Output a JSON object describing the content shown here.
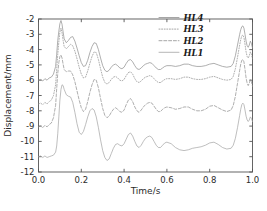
{
  "chart_data": {
    "type": "line",
    "title": "",
    "xlabel": "Time/s",
    "ylabel": "Displacement/mm",
    "xlim": [
      0.0,
      1.0
    ],
    "ylim": [
      -12,
      -2
    ],
    "xticks": [
      "0.0",
      "0.2",
      "0.4",
      "0.6",
      "0.8",
      "1.0"
    ],
    "xtick_values": [
      0.0,
      0.2,
      0.4,
      0.6,
      0.8,
      1.0
    ],
    "yticks": [
      "-2",
      "-3",
      "-4",
      "-5",
      "-6",
      "-7",
      "-8",
      "-9",
      "-10",
      "-11",
      "-12"
    ],
    "ytick_values": [
      -2,
      -3,
      -4,
      -5,
      -6,
      -7,
      -8,
      -9,
      -10,
      -11,
      -12
    ],
    "grid": false,
    "legend_position": "top-right",
    "legend_entries": [
      "HL4",
      "HL3",
      "HL2",
      "HL1"
    ],
    "line_color": "#8a8a8a",
    "axis_color": "#555555",
    "series": [
      {
        "name": "HL4",
        "style": "solid",
        "color": "#8f8f8f",
        "x": [
          0.0,
          0.01,
          0.02,
          0.03,
          0.04,
          0.05,
          0.06,
          0.07,
          0.08,
          0.085,
          0.09,
          0.095,
          0.1,
          0.105,
          0.11,
          0.115,
          0.12,
          0.13,
          0.14,
          0.15,
          0.16,
          0.17,
          0.18,
          0.19,
          0.2,
          0.21,
          0.22,
          0.23,
          0.24,
          0.25,
          0.26,
          0.27,
          0.28,
          0.29,
          0.3,
          0.31,
          0.32,
          0.33,
          0.34,
          0.35,
          0.36,
          0.37,
          0.38,
          0.39,
          0.4,
          0.41,
          0.42,
          0.43,
          0.44,
          0.45,
          0.46,
          0.47,
          0.48,
          0.49,
          0.5,
          0.51,
          0.52,
          0.53,
          0.54,
          0.55,
          0.56,
          0.57,
          0.58,
          0.59,
          0.6,
          0.62,
          0.64,
          0.66,
          0.68,
          0.7,
          0.72,
          0.74,
          0.76,
          0.78,
          0.8,
          0.82,
          0.84,
          0.86,
          0.88,
          0.9,
          0.91,
          0.92,
          0.93,
          0.94,
          0.945,
          0.95,
          0.955,
          0.96,
          0.965,
          0.97,
          0.975,
          0.98,
          0.985,
          0.99,
          0.995,
          1.0
        ],
        "y": [
          -6.0,
          -5.95,
          -6.05,
          -5.9,
          -6.0,
          -5.85,
          -5.8,
          -5.6,
          -5.1,
          -4.3,
          -3.4,
          -2.8,
          -2.3,
          -2.1,
          -2.35,
          -2.85,
          -3.3,
          -3.55,
          -3.4,
          -3.2,
          -3.15,
          -3.45,
          -3.9,
          -4.4,
          -4.85,
          -5.1,
          -5.05,
          -4.7,
          -4.2,
          -3.8,
          -3.55,
          -3.6,
          -4.0,
          -4.55,
          -5.05,
          -5.35,
          -5.45,
          -5.35,
          -5.15,
          -5.0,
          -4.95,
          -5.05,
          -5.2,
          -5.25,
          -5.15,
          -4.9,
          -4.7,
          -4.65,
          -4.8,
          -5.05,
          -5.25,
          -5.3,
          -5.2,
          -5.05,
          -4.95,
          -4.9,
          -4.85,
          -4.9,
          -5.05,
          -5.2,
          -5.3,
          -5.3,
          -5.2,
          -5.1,
          -5.05,
          -5.05,
          -5.1,
          -5.05,
          -4.95,
          -4.95,
          -5.05,
          -5.1,
          -5.1,
          -5.05,
          -4.95,
          -4.9,
          -5.0,
          -5.1,
          -5.15,
          -5.1,
          -4.9,
          -4.4,
          -3.7,
          -3.0,
          -2.7,
          -2.5,
          -2.45,
          -2.6,
          -3.0,
          -3.45,
          -3.75,
          -3.85,
          -3.7,
          -3.45,
          -3.6,
          -3.9
        ]
      },
      {
        "name": "HL3",
        "style": "dotted",
        "color": "#8f8f8f",
        "x": [
          0.0,
          0.01,
          0.02,
          0.03,
          0.04,
          0.05,
          0.06,
          0.07,
          0.08,
          0.085,
          0.09,
          0.095,
          0.1,
          0.105,
          0.11,
          0.115,
          0.12,
          0.13,
          0.14,
          0.15,
          0.16,
          0.17,
          0.18,
          0.19,
          0.2,
          0.21,
          0.22,
          0.23,
          0.24,
          0.25,
          0.26,
          0.27,
          0.28,
          0.29,
          0.3,
          0.31,
          0.32,
          0.33,
          0.34,
          0.35,
          0.36,
          0.37,
          0.38,
          0.39,
          0.4,
          0.41,
          0.42,
          0.43,
          0.44,
          0.45,
          0.46,
          0.47,
          0.48,
          0.49,
          0.5,
          0.51,
          0.52,
          0.53,
          0.54,
          0.55,
          0.56,
          0.57,
          0.58,
          0.59,
          0.6,
          0.62,
          0.64,
          0.66,
          0.68,
          0.7,
          0.72,
          0.74,
          0.76,
          0.78,
          0.8,
          0.82,
          0.84,
          0.86,
          0.88,
          0.9,
          0.91,
          0.92,
          0.93,
          0.94,
          0.945,
          0.95,
          0.955,
          0.96,
          0.965,
          0.97,
          0.975,
          0.98,
          0.985,
          0.99,
          0.995,
          1.0
        ],
        "y": [
          -7.55,
          -7.5,
          -7.6,
          -7.45,
          -7.55,
          -7.4,
          -7.3,
          -7.0,
          -6.3,
          -5.3,
          -4.3,
          -3.5,
          -2.85,
          -2.6,
          -2.9,
          -3.4,
          -3.8,
          -3.95,
          -3.8,
          -3.65,
          -3.75,
          -4.1,
          -4.6,
          -5.15,
          -5.6,
          -5.85,
          -5.8,
          -5.4,
          -4.9,
          -4.45,
          -4.15,
          -4.2,
          -4.65,
          -5.25,
          -5.8,
          -6.15,
          -6.25,
          -6.15,
          -5.95,
          -5.8,
          -5.75,
          -5.85,
          -6.0,
          -6.05,
          -5.95,
          -5.7,
          -5.5,
          -5.45,
          -5.6,
          -5.9,
          -6.1,
          -6.15,
          -6.05,
          -5.9,
          -5.8,
          -5.75,
          -5.7,
          -5.75,
          -5.9,
          -6.05,
          -6.15,
          -6.15,
          -6.05,
          -5.95,
          -5.9,
          -5.9,
          -5.95,
          -5.9,
          -5.8,
          -5.8,
          -5.9,
          -5.95,
          -5.95,
          -5.9,
          -5.8,
          -5.75,
          -5.85,
          -5.95,
          -6.0,
          -5.95,
          -5.75,
          -5.25,
          -4.5,
          -3.7,
          -3.35,
          -3.1,
          -3.05,
          -3.2,
          -3.65,
          -4.15,
          -4.45,
          -4.55,
          -4.4,
          -4.15,
          -4.3,
          -4.6
        ]
      },
      {
        "name": "HL2",
        "style": "dashed",
        "color": "#8f8f8f",
        "x": [
          0.0,
          0.01,
          0.02,
          0.03,
          0.04,
          0.05,
          0.06,
          0.07,
          0.08,
          0.085,
          0.09,
          0.095,
          0.1,
          0.105,
          0.11,
          0.115,
          0.12,
          0.13,
          0.14,
          0.15,
          0.16,
          0.17,
          0.18,
          0.19,
          0.2,
          0.21,
          0.22,
          0.23,
          0.24,
          0.25,
          0.26,
          0.27,
          0.28,
          0.29,
          0.3,
          0.31,
          0.32,
          0.33,
          0.34,
          0.35,
          0.36,
          0.37,
          0.38,
          0.39,
          0.4,
          0.41,
          0.42,
          0.43,
          0.44,
          0.45,
          0.46,
          0.47,
          0.48,
          0.49,
          0.5,
          0.51,
          0.52,
          0.53,
          0.54,
          0.55,
          0.56,
          0.57,
          0.58,
          0.59,
          0.6,
          0.62,
          0.64,
          0.66,
          0.68,
          0.7,
          0.72,
          0.74,
          0.76,
          0.78,
          0.8,
          0.82,
          0.84,
          0.86,
          0.88,
          0.9,
          0.91,
          0.92,
          0.93,
          0.94,
          0.945,
          0.95,
          0.955,
          0.96,
          0.965,
          0.97,
          0.975,
          0.98,
          0.985,
          0.99,
          0.995,
          1.0
        ],
        "y": [
          -9.05,
          -9.0,
          -9.1,
          -8.95,
          -9.05,
          -8.9,
          -8.8,
          -8.45,
          -7.65,
          -6.55,
          -5.55,
          -4.85,
          -4.45,
          -4.35,
          -4.55,
          -4.95,
          -5.3,
          -5.45,
          -5.4,
          -5.4,
          -5.65,
          -6.1,
          -6.7,
          -7.3,
          -7.8,
          -8.05,
          -7.9,
          -7.4,
          -6.8,
          -6.3,
          -5.95,
          -6.0,
          -6.5,
          -7.2,
          -7.85,
          -8.3,
          -8.45,
          -8.35,
          -8.1,
          -7.9,
          -7.8,
          -7.9,
          -8.05,
          -8.1,
          -7.95,
          -7.6,
          -7.3,
          -7.2,
          -7.4,
          -7.75,
          -8.0,
          -8.1,
          -7.95,
          -7.75,
          -7.6,
          -7.5,
          -7.45,
          -7.5,
          -7.7,
          -7.9,
          -8.05,
          -8.05,
          -7.9,
          -7.8,
          -7.75,
          -7.8,
          -7.9,
          -7.85,
          -7.75,
          -7.75,
          -7.9,
          -8.0,
          -8.0,
          -7.9,
          -7.7,
          -7.65,
          -7.8,
          -7.95,
          -8.05,
          -7.95,
          -7.65,
          -7.05,
          -6.2,
          -5.35,
          -4.95,
          -4.7,
          -4.65,
          -4.8,
          -5.3,
          -5.85,
          -6.2,
          -6.35,
          -6.2,
          -5.95,
          -6.1,
          -6.4
        ]
      },
      {
        "name": "HL1",
        "style": "solid",
        "color": "#a5a5a5",
        "x": [
          0.0,
          0.01,
          0.02,
          0.03,
          0.04,
          0.05,
          0.06,
          0.07,
          0.08,
          0.085,
          0.09,
          0.095,
          0.1,
          0.105,
          0.11,
          0.115,
          0.12,
          0.13,
          0.14,
          0.15,
          0.16,
          0.17,
          0.18,
          0.19,
          0.2,
          0.21,
          0.22,
          0.23,
          0.24,
          0.25,
          0.26,
          0.27,
          0.28,
          0.29,
          0.3,
          0.31,
          0.32,
          0.33,
          0.34,
          0.35,
          0.36,
          0.37,
          0.38,
          0.39,
          0.4,
          0.41,
          0.42,
          0.43,
          0.44,
          0.45,
          0.46,
          0.47,
          0.48,
          0.49,
          0.5,
          0.51,
          0.52,
          0.53,
          0.54,
          0.55,
          0.56,
          0.57,
          0.58,
          0.59,
          0.6,
          0.62,
          0.64,
          0.66,
          0.68,
          0.7,
          0.72,
          0.74,
          0.76,
          0.78,
          0.8,
          0.82,
          0.84,
          0.86,
          0.88,
          0.9,
          0.91,
          0.92,
          0.93,
          0.94,
          0.945,
          0.95,
          0.955,
          0.96,
          0.965,
          0.97,
          0.975,
          0.98,
          0.985,
          0.99,
          0.995,
          1.0
        ],
        "y": [
          -11.0,
          -10.95,
          -11.05,
          -10.95,
          -11.05,
          -11.0,
          -10.95,
          -10.9,
          -10.7,
          -10.3,
          -9.5,
          -8.4,
          -7.3,
          -6.6,
          -6.3,
          -6.35,
          -6.6,
          -6.95,
          -7.05,
          -7.1,
          -7.45,
          -8.1,
          -8.85,
          -9.4,
          -9.55,
          -9.35,
          -8.9,
          -8.4,
          -8.0,
          -7.85,
          -7.95,
          -8.4,
          -9.1,
          -9.9,
          -10.6,
          -11.05,
          -11.25,
          -11.15,
          -10.8,
          -10.45,
          -10.2,
          -10.15,
          -10.25,
          -10.3,
          -10.15,
          -9.85,
          -9.55,
          -9.45,
          -9.65,
          -10.0,
          -10.3,
          -10.4,
          -10.25,
          -10.0,
          -9.8,
          -9.7,
          -9.65,
          -9.75,
          -10.0,
          -10.25,
          -10.4,
          -10.4,
          -10.25,
          -10.1,
          -10.05,
          -10.15,
          -10.4,
          -10.55,
          -10.6,
          -10.55,
          -10.45,
          -10.4,
          -10.35,
          -10.25,
          -10.1,
          -10.05,
          -10.2,
          -10.4,
          -10.5,
          -10.45,
          -10.25,
          -9.8,
          -9.1,
          -8.3,
          -7.9,
          -7.6,
          -7.5,
          -7.6,
          -7.95,
          -8.35,
          -8.6,
          -8.7,
          -8.6,
          -8.4,
          -8.5,
          -8.7
        ]
      }
    ]
  }
}
